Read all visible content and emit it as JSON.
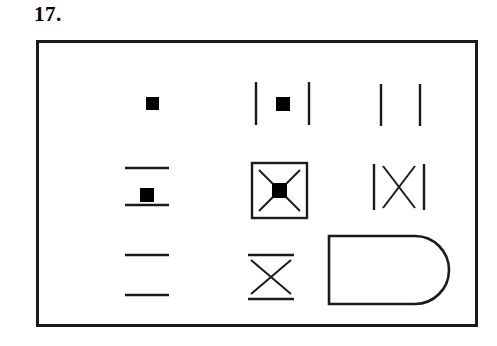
{
  "item": {
    "number_label": "17.",
    "type": "matrix-reasoning-3x3"
  },
  "colors": {
    "ink": "#1a1a1a",
    "fill": "#000000",
    "background": "#ffffff"
  },
  "frame": {
    "border_width_px": 3,
    "x": 36,
    "y": 40,
    "width": 442,
    "height": 287
  },
  "matrix": {
    "rows": 3,
    "columns": 3,
    "cells": [
      {
        "index": 1,
        "row": 1,
        "column": 1,
        "name": "cell-r1c1",
        "description": "small filled black square",
        "elements": [
          "filled-square"
        ],
        "brackets": "none"
      },
      {
        "index": 2,
        "row": 1,
        "column": 2,
        "name": "cell-r1c2",
        "description": "small filled black square between two vertical lines",
        "elements": [
          "filled-square"
        ],
        "brackets": "vertical"
      },
      {
        "index": 3,
        "row": 1,
        "column": 3,
        "name": "cell-r1c3",
        "description": "two vertical lines with empty space between",
        "elements": [
          "none"
        ],
        "brackets": "vertical"
      },
      {
        "index": 4,
        "row": 2,
        "column": 1,
        "name": "cell-r2c1",
        "description": "small filled black square between two horizontal lines",
        "elements": [
          "filled-square"
        ],
        "brackets": "horizontal"
      },
      {
        "index": 5,
        "row": 2,
        "column": 2,
        "name": "cell-r2c2",
        "description": "square outline box containing an X with a filled square at its centre",
        "elements": [
          "x-cross",
          "filled-square"
        ],
        "brackets": "box"
      },
      {
        "index": 6,
        "row": 2,
        "column": 3,
        "name": "cell-r2c3",
        "description": "X shape between two vertical lines",
        "elements": [
          "x-cross"
        ],
        "brackets": "vertical"
      },
      {
        "index": 7,
        "row": 3,
        "column": 1,
        "name": "cell-r3c1",
        "description": "two horizontal lines with empty space between",
        "elements": [
          "none"
        ],
        "brackets": "horizontal"
      },
      {
        "index": 8,
        "row": 3,
        "column": 2,
        "name": "cell-r3c2",
        "description": "X shape between two horizontal lines",
        "elements": [
          "x-cross"
        ],
        "brackets": "horizontal"
      },
      {
        "index": 9,
        "row": 3,
        "column": 3,
        "name": "cell-r3c3",
        "description": "D shape: rectangle with rounded right end",
        "elements": [
          "d-shape"
        ],
        "brackets": "none"
      }
    ]
  }
}
